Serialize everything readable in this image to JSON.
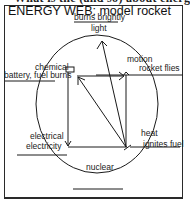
{
  "header": {
    "cutoff_text": "What is the (and so) about energy?",
    "title": "ENERGY WEB: model rocket"
  },
  "nodes": {
    "light": {
      "example": "burns brightly",
      "form": "light"
    },
    "chemical": {
      "form": "chemical",
      "example": "battery, fuel burns"
    },
    "motion": {
      "form": "motion",
      "example": "rocket flies"
    },
    "electrical": {
      "form": "electrical",
      "example": "electricity"
    },
    "heat": {
      "form": "heat",
      "example": "ignites fuel"
    },
    "nuclear": {
      "form": "nuclear",
      "example": ""
    }
  },
  "arrows": [
    {
      "from": "heat",
      "to": "light"
    },
    {
      "from": "heat",
      "to": "chemical"
    },
    {
      "from": "chemical",
      "to": "motion"
    },
    {
      "from": "chemical",
      "to": "electrical"
    },
    {
      "from": "electrical",
      "to": "heat"
    },
    {
      "from": "motion",
      "to": "heat"
    }
  ],
  "colors": {
    "ink": "#1a1a1a",
    "background": "#ffffff"
  }
}
